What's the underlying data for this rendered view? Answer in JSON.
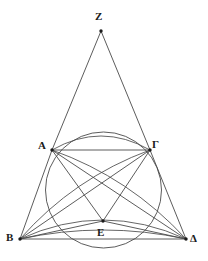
{
  "figure": {
    "kind": "geometric-diagram",
    "background_color": "#ffffff",
    "stroke_color": "#4a4a4a",
    "label_color": "#1a1a1a",
    "points": [
      {
        "name": "Z",
        "label": "Z",
        "x": 101,
        "y": 31,
        "label_x": 95,
        "label_y": 11
      },
      {
        "name": "A",
        "label": "A",
        "x": 52,
        "y": 150,
        "label_x": 38,
        "label_y": 140
      },
      {
        "name": "G",
        "label": "Γ",
        "x": 150,
        "y": 150,
        "label_x": 152,
        "label_y": 139
      },
      {
        "name": "B",
        "label": "B",
        "x": 20,
        "y": 239,
        "label_x": 6,
        "label_y": 232
      },
      {
        "name": "D",
        "label": "Δ",
        "x": 186,
        "y": 239,
        "label_x": 190,
        "label_y": 233
      },
      {
        "name": "E",
        "label": "E",
        "x": 103,
        "y": 221,
        "label_x": 97,
        "label_y": 227
      }
    ],
    "circle": {
      "cx": 103.5,
      "cy": 190,
      "r": 58
    },
    "segments": [
      {
        "name": "ZA",
        "from": "Z",
        "to": "A"
      },
      {
        "name": "ZG",
        "from": "Z",
        "to": "G"
      },
      {
        "name": "AG",
        "from": "A",
        "to": "G"
      },
      {
        "name": "BD",
        "from": "B",
        "to": "D"
      },
      {
        "name": "AB",
        "from": "A",
        "to": "B"
      },
      {
        "name": "GD",
        "from": "G",
        "to": "D"
      },
      {
        "name": "AD",
        "from": "A",
        "to": "D"
      },
      {
        "name": "BG",
        "from": "B",
        "to": "G"
      },
      {
        "name": "AE",
        "from": "A",
        "to": "E"
      },
      {
        "name": "GE",
        "from": "G",
        "to": "E"
      },
      {
        "name": "BE",
        "from": "B",
        "to": "E"
      },
      {
        "name": "ED",
        "from": "E",
        "to": "D"
      }
    ],
    "arcs": [
      {
        "name": "arc-A-G-upper",
        "from": "A",
        "to": "G",
        "bulge": 14
      },
      {
        "name": "arc-B-D-upper",
        "from": "B",
        "to": "D",
        "bulge": 19
      },
      {
        "name": "arc-B-D-lower",
        "from": "B",
        "to": "D",
        "bulge": 9
      },
      {
        "name": "arc-B-G-inner",
        "from": "B",
        "to": "G",
        "bulge": 10
      },
      {
        "name": "arc-A-D-inner",
        "from": "A",
        "to": "D",
        "bulge": 10
      }
    ]
  }
}
